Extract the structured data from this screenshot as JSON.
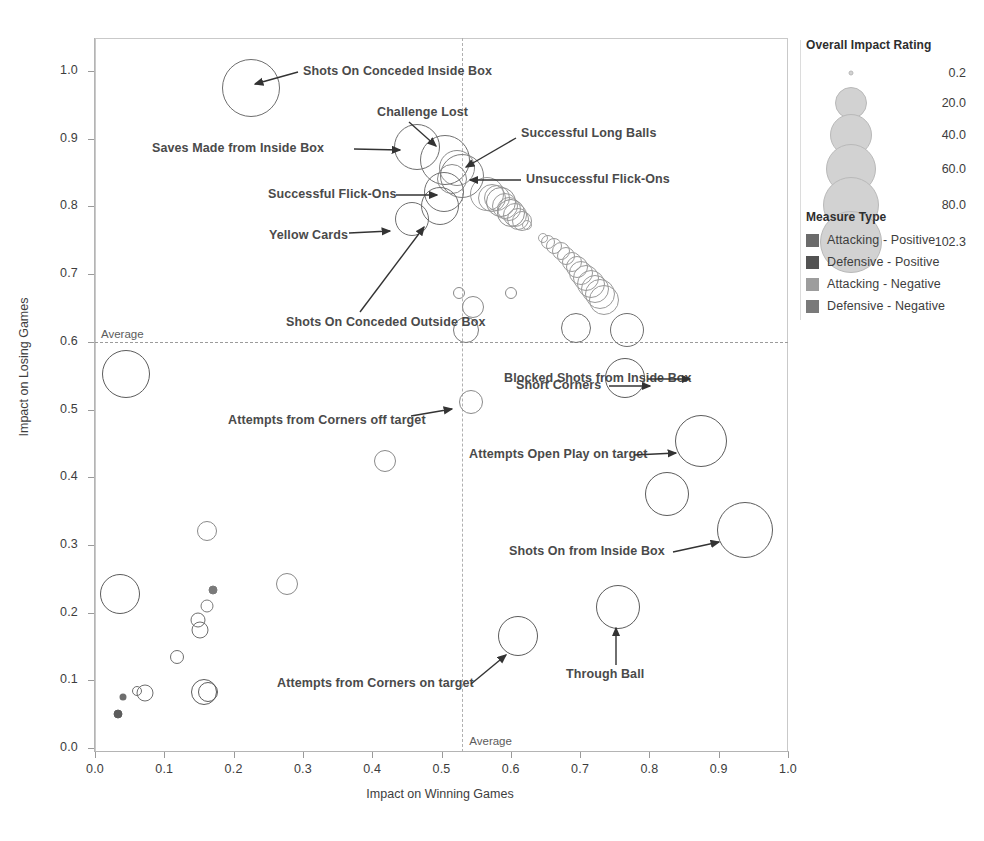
{
  "chart_data": {
    "type": "scatter",
    "title": "",
    "xlabel": "Impact on Winning Games",
    "ylabel": "Impact on Losing Games",
    "xlim": [
      0.0,
      1.0
    ],
    "ylim": [
      0.0,
      1.05
    ],
    "grid": false,
    "x_ticks": [
      "0.0",
      "0.1",
      "0.2",
      "0.3",
      "0.4",
      "0.5",
      "0.6",
      "0.7",
      "0.8",
      "0.9",
      "1.0"
    ],
    "x_tick_values": [
      0.0,
      0.1,
      0.2,
      0.3,
      0.4,
      0.5,
      0.6,
      0.7,
      0.8,
      0.9,
      1.0
    ],
    "y_ticks": [
      "0.0",
      "0.1",
      "0.2",
      "0.3",
      "0.4",
      "0.5",
      "0.6",
      "0.7",
      "0.8",
      "0.9",
      "1.0"
    ],
    "y_tick_values": [
      0.0,
      0.1,
      0.2,
      0.3,
      0.4,
      0.5,
      0.6,
      0.7,
      0.8,
      0.9,
      1.0
    ],
    "reference_lines": [
      {
        "orientation": "horizontal",
        "value": 0.6,
        "label": "Average"
      },
      {
        "orientation": "vertical",
        "value": 0.53,
        "label": "Average"
      }
    ],
    "points": [
      {
        "x": 0.225,
        "y": 0.975,
        "size": 58,
        "color": "#6e6e6e",
        "label": "Shots On Conceded Inside Box"
      },
      {
        "x": 0.465,
        "y": 0.888,
        "size": 46,
        "color": "#6e6e6e",
        "label": "Saves Made from Inside Box"
      },
      {
        "x": 0.505,
        "y": 0.868,
        "size": 50,
        "color": "#707070",
        "label": "Challenge Lost"
      },
      {
        "x": 0.522,
        "y": 0.857,
        "size": 36,
        "color": "#8a8a8a",
        "label": ""
      },
      {
        "x": 0.53,
        "y": 0.845,
        "size": 44,
        "color": "#7d7d7d",
        "label": "Unsuccessful Flick-Ons"
      },
      {
        "x": 0.515,
        "y": 0.84,
        "size": 30,
        "color": "#8a8a8a",
        "label": "Successful Long Balls"
      },
      {
        "x": 0.503,
        "y": 0.822,
        "size": 40,
        "color": "#707070",
        "label": "Successful Flick-Ons"
      },
      {
        "x": 0.498,
        "y": 0.8,
        "size": 38,
        "color": "#6e6e6e",
        "label": "Shots On Conceded Outside Box"
      },
      {
        "x": 0.458,
        "y": 0.782,
        "size": 34,
        "color": "#6e6e6e",
        "label": "Yellow Cards"
      },
      {
        "x": 0.566,
        "y": 0.818,
        "size": 34,
        "color": "#9a9a9a",
        "label": ""
      },
      {
        "x": 0.573,
        "y": 0.812,
        "size": 28,
        "color": "#9a9a9a",
        "label": ""
      },
      {
        "x": 0.58,
        "y": 0.812,
        "size": 26,
        "color": "#9a9a9a",
        "label": ""
      },
      {
        "x": 0.586,
        "y": 0.806,
        "size": 30,
        "color": "#8e8e8e",
        "label": ""
      },
      {
        "x": 0.592,
        "y": 0.8,
        "size": 26,
        "color": "#9a9a9a",
        "label": ""
      },
      {
        "x": 0.597,
        "y": 0.796,
        "size": 24,
        "color": "#9a9a9a",
        "label": ""
      },
      {
        "x": 0.6,
        "y": 0.79,
        "size": 28,
        "color": "#8e8e8e",
        "label": ""
      },
      {
        "x": 0.606,
        "y": 0.787,
        "size": 24,
        "color": "#9a9a9a",
        "label": ""
      },
      {
        "x": 0.61,
        "y": 0.782,
        "size": 22,
        "color": "#9a9a9a",
        "label": ""
      },
      {
        "x": 0.616,
        "y": 0.778,
        "size": 20,
        "color": "#9a9a9a",
        "label": ""
      },
      {
        "x": 0.624,
        "y": 0.772,
        "size": 10,
        "color": "#a4a4a4",
        "label": ""
      },
      {
        "x": 0.646,
        "y": 0.754,
        "size": 10,
        "color": "#a4a4a4",
        "label": ""
      },
      {
        "x": 0.654,
        "y": 0.748,
        "size": 14,
        "color": "#9a9a9a",
        "label": ""
      },
      {
        "x": 0.663,
        "y": 0.742,
        "size": 16,
        "color": "#9a9a9a",
        "label": ""
      },
      {
        "x": 0.672,
        "y": 0.734,
        "size": 18,
        "color": "#9a9a9a",
        "label": ""
      },
      {
        "x": 0.68,
        "y": 0.726,
        "size": 18,
        "color": "#9a9a9a",
        "label": ""
      },
      {
        "x": 0.688,
        "y": 0.718,
        "size": 20,
        "color": "#9a9a9a",
        "label": ""
      },
      {
        "x": 0.695,
        "y": 0.71,
        "size": 22,
        "color": "#9a9a9a",
        "label": ""
      },
      {
        "x": 0.701,
        "y": 0.702,
        "size": 24,
        "color": "#9a9a9a",
        "label": ""
      },
      {
        "x": 0.708,
        "y": 0.694,
        "size": 26,
        "color": "#9a9a9a",
        "label": ""
      },
      {
        "x": 0.716,
        "y": 0.686,
        "size": 28,
        "color": "#9a9a9a",
        "label": ""
      },
      {
        "x": 0.722,
        "y": 0.678,
        "size": 28,
        "color": "#9a9a9a",
        "label": ""
      },
      {
        "x": 0.729,
        "y": 0.67,
        "size": 30,
        "color": "#9a9a9a",
        "label": ""
      },
      {
        "x": 0.735,
        "y": 0.662,
        "size": 30,
        "color": "#9a9a9a",
        "label": ""
      },
      {
        "x": 0.6,
        "y": 0.672,
        "size": 12,
        "color": "#8a8a8a",
        "label": ""
      },
      {
        "x": 0.525,
        "y": 0.672,
        "size": 12,
        "color": "#8a8a8a",
        "label": ""
      },
      {
        "x": 0.545,
        "y": 0.652,
        "size": 22,
        "color": "#8a8a8a",
        "label": ""
      },
      {
        "x": 0.536,
        "y": 0.618,
        "size": 26,
        "color": "#7a7a7a",
        "label": ""
      },
      {
        "x": 0.694,
        "y": 0.62,
        "size": 30,
        "color": "#6e6e6e",
        "label": ""
      },
      {
        "x": 0.768,
        "y": 0.618,
        "size": 34,
        "color": "#6e6e6e",
        "label": ""
      },
      {
        "x": 0.045,
        "y": 0.552,
        "size": 48,
        "color": "#5c5c5c",
        "label": ""
      },
      {
        "x": 0.765,
        "y": 0.547,
        "size": 40,
        "color": "#5c5c5c",
        "label": "Blocked Shots from Inside Box"
      },
      {
        "x": 0.543,
        "y": 0.511,
        "size": 24,
        "color": "#8a8a8a",
        "label": "Attempts from Corners off target"
      },
      {
        "x": 0.875,
        "y": 0.453,
        "size": 52,
        "color": "#5c5c5c",
        "label": "Attempts Open Play on target"
      },
      {
        "x": 0.418,
        "y": 0.424,
        "size": 22,
        "color": "#8a8a8a",
        "label": ""
      },
      {
        "x": 0.826,
        "y": 0.375,
        "size": 44,
        "color": "#5c5c5c",
        "label": "Short Corners"
      },
      {
        "x": 0.938,
        "y": 0.322,
        "size": 56,
        "color": "#5c5c5c",
        "label": "Shots On from Inside Box"
      },
      {
        "x": 0.162,
        "y": 0.32,
        "size": 20,
        "color": "#8a8a8a",
        "label": ""
      },
      {
        "x": 0.277,
        "y": 0.242,
        "size": 22,
        "color": "#8a8a8a",
        "label": ""
      },
      {
        "x": 0.036,
        "y": 0.228,
        "size": 40,
        "color": "#5c5c5c",
        "label": ""
      },
      {
        "x": 0.17,
        "y": 0.233,
        "size": 9,
        "color": "#7a7a7a",
        "label": ""
      },
      {
        "x": 0.162,
        "y": 0.21,
        "size": 13,
        "color": "#7a7a7a",
        "label": ""
      },
      {
        "x": 0.148,
        "y": 0.189,
        "size": 15,
        "color": "#6e6e6e",
        "label": ""
      },
      {
        "x": 0.152,
        "y": 0.174,
        "size": 17,
        "color": "#6e6e6e",
        "label": ""
      },
      {
        "x": 0.755,
        "y": 0.208,
        "size": 44,
        "color": "#5c5c5c",
        "label": "Through Ball"
      },
      {
        "x": 0.61,
        "y": 0.165,
        "size": 40,
        "color": "#5c5c5c",
        "label": "Attempts from Corners on target"
      },
      {
        "x": 0.118,
        "y": 0.134,
        "size": 14,
        "color": "#6e6e6e",
        "label": ""
      },
      {
        "x": 0.158,
        "y": 0.082,
        "size": 26,
        "color": "#5c5c5c",
        "label": ""
      },
      {
        "x": 0.163,
        "y": 0.082,
        "size": 20,
        "color": "#5c5c5c",
        "label": ""
      },
      {
        "x": 0.072,
        "y": 0.081,
        "size": 17,
        "color": "#6e6e6e",
        "label": ""
      },
      {
        "x": 0.061,
        "y": 0.084,
        "size": 10,
        "color": "#6e6e6e",
        "label": ""
      },
      {
        "x": 0.041,
        "y": 0.075,
        "size": 7,
        "color": "#6e6e6e",
        "label": ""
      },
      {
        "x": 0.033,
        "y": 0.05,
        "size": 9,
        "color": "#5c5c5c",
        "label": ""
      }
    ],
    "annotations": [
      {
        "label": "Shots On Conceded Inside Box",
        "text_x": 303,
        "text_y": 72,
        "align": "left",
        "ax": 298,
        "ay": 72,
        "tx": 255,
        "ty": 84
      },
      {
        "label": "Challenge Lost",
        "text_x": 377,
        "text_y": 113,
        "align": "left",
        "ax": 409,
        "ay": 122,
        "tx": 436,
        "ty": 146
      },
      {
        "label": "Saves Made from Inside Box",
        "text_x": 152,
        "text_y": 149,
        "align": "left",
        "ax": 354,
        "ay": 149,
        "tx": 400,
        "ty": 150
      },
      {
        "label": "Successful Long Balls",
        "text_x": 521,
        "text_y": 134,
        "align": "left",
        "ax": 516,
        "ay": 138,
        "tx": 466,
        "ty": 167
      },
      {
        "label": "Unsuccessful Flick-Ons",
        "text_x": 526,
        "text_y": 180,
        "align": "left",
        "ax": 521,
        "ay": 180,
        "tx": 470,
        "ty": 180
      },
      {
        "label": "Successful Flick-Ons",
        "text_x": 268,
        "text_y": 195,
        "align": "left",
        "ax": 396,
        "ay": 195,
        "tx": 437,
        "ty": 195
      },
      {
        "label": "Yellow Cards",
        "text_x": 269,
        "text_y": 236,
        "align": "left",
        "ax": 349,
        "ay": 233,
        "tx": 390,
        "ty": 231
      },
      {
        "label": "Shots On Conceded Outside Box",
        "text_x": 286,
        "text_y": 323,
        "align": "left",
        "ax": 360,
        "ay": 312,
        "tx": 424,
        "ty": 227
      },
      {
        "label": "Blocked Shots from Inside Box",
        "text_x": 504,
        "text_y": 379,
        "align": "left",
        "ax": 648,
        "ay": 379,
        "tx": 690,
        "ty": 379
      },
      {
        "label": "Attempts from Corners off target",
        "text_x": 228,
        "text_y": 421,
        "align": "left",
        "ax": 411,
        "ay": 416,
        "tx": 452,
        "ty": 409
      },
      {
        "label": "Attempts Open Play on target",
        "text_x": 469,
        "text_y": 455,
        "align": "left",
        "ax": 634,
        "ay": 455,
        "tx": 676,
        "ty": 453
      },
      {
        "label": "Short Corners",
        "text_x": 516,
        "text_y": 386,
        "align": "left",
        "ax": 609,
        "ay": 386,
        "tx": 650,
        "ty": 386
      },
      {
        "label": "Shots On from Inside Box",
        "text_x": 509,
        "text_y": 552,
        "align": "left",
        "ax": 673,
        "ay": 552,
        "tx": 719,
        "ty": 542
      },
      {
        "label": "Through Ball",
        "text_x": 566,
        "text_y": 675,
        "align": "left",
        "ax": 616,
        "ay": 665,
        "tx": 616,
        "ty": 628
      },
      {
        "label": "Attempts from Corners on target",
        "text_x": 277,
        "text_y": 684,
        "align": "left",
        "ax": 471,
        "ay": 684,
        "tx": 506,
        "ty": 655
      }
    ]
  },
  "size_legend": {
    "title": "Overall Impact Rating",
    "entries": [
      {
        "label": "0.2",
        "radius": 1.5,
        "cy": 70
      },
      {
        "label": "20.0",
        "radius": 15,
        "cy": 100
      },
      {
        "label": "40.0",
        "radius": 20,
        "cy": 132
      },
      {
        "label": "60.0",
        "radius": 24,
        "cy": 166
      },
      {
        "label": "80.0",
        "radius": 27,
        "cy": 202
      },
      {
        "label": "102.3",
        "radius": 30,
        "cy": 239
      }
    ],
    "swatch_fill": "#d2d2d2",
    "swatch_stroke": "#b9b9b9"
  },
  "type_legend": {
    "title": "Measure Type",
    "entries": [
      {
        "label": "Attacking - Positive",
        "color": "#6b6b6b"
      },
      {
        "label": "Defensive - Positive",
        "color": "#535353"
      },
      {
        "label": "Attacking - Negative",
        "color": "#9d9d9d"
      },
      {
        "label": "Defensive - Negative",
        "color": "#7a7a7a"
      }
    ]
  }
}
